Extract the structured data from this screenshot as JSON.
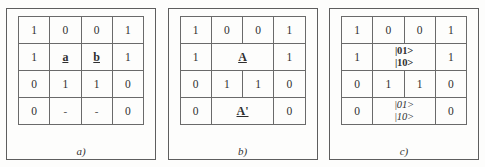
{
  "figure": {
    "panels": [
      {
        "id": "a",
        "label": "a)",
        "rows": [
          {
            "cells": [
              {
                "text": "1",
                "kind": "bit",
                "colspan": 1
              },
              {
                "text": "0",
                "kind": "bit",
                "colspan": 1
              },
              {
                "text": "0",
                "kind": "bit",
                "colspan": 1
              },
              {
                "text": "1",
                "kind": "bit",
                "colspan": 1
              }
            ]
          },
          {
            "cells": [
              {
                "text": "1",
                "kind": "bit",
                "colspan": 1
              },
              {
                "text": "a",
                "kind": "sym",
                "colspan": 1
              },
              {
                "text": "b",
                "kind": "sym",
                "colspan": 1
              },
              {
                "text": "1",
                "kind": "bit",
                "colspan": 1
              }
            ]
          },
          {
            "cells": [
              {
                "text": "0",
                "kind": "bit",
                "colspan": 1
              },
              {
                "text": "1",
                "kind": "bit",
                "colspan": 1
              },
              {
                "text": "1",
                "kind": "bit",
                "colspan": 1
              },
              {
                "text": "0",
                "kind": "bit",
                "colspan": 1
              }
            ]
          },
          {
            "cells": [
              {
                "text": "0",
                "kind": "bit",
                "colspan": 1
              },
              {
                "text": "-",
                "kind": "dash",
                "colspan": 1
              },
              {
                "text": "-",
                "kind": "dash",
                "colspan": 1
              },
              {
                "text": "0",
                "kind": "bit",
                "colspan": 1
              }
            ]
          }
        ]
      },
      {
        "id": "b",
        "label": "b)",
        "rows": [
          {
            "cells": [
              {
                "text": "1",
                "kind": "bit",
                "colspan": 1
              },
              {
                "text": "0",
                "kind": "bit",
                "colspan": 1
              },
              {
                "text": "0",
                "kind": "bit",
                "colspan": 1
              },
              {
                "text": "1",
                "kind": "bit",
                "colspan": 1
              }
            ]
          },
          {
            "cells": [
              {
                "text": "1",
                "kind": "bit",
                "colspan": 1
              },
              {
                "text": "A",
                "kind": "sym",
                "colspan": 2
              },
              {
                "text": "1",
                "kind": "bit",
                "colspan": 1
              }
            ]
          },
          {
            "cells": [
              {
                "text": "0",
                "kind": "bit",
                "colspan": 1
              },
              {
                "text": "1",
                "kind": "bit",
                "colspan": 1
              },
              {
                "text": "1",
                "kind": "bit",
                "colspan": 1
              },
              {
                "text": "0",
                "kind": "bit",
                "colspan": 1
              }
            ]
          },
          {
            "cells": [
              {
                "text": "0",
                "kind": "bit",
                "colspan": 1
              },
              {
                "text": "A'",
                "kind": "sym-prime",
                "colspan": 2
              },
              {
                "text": "0",
                "kind": "bit",
                "colspan": 1
              }
            ]
          }
        ]
      },
      {
        "id": "c",
        "label": "c)",
        "rows": [
          {
            "cells": [
              {
                "text": "1",
                "kind": "bit",
                "colspan": 1
              },
              {
                "text": "0",
                "kind": "bit",
                "colspan": 1
              },
              {
                "text": "0",
                "kind": "bit",
                "colspan": 1
              },
              {
                "text": "1",
                "kind": "bit",
                "colspan": 1
              }
            ]
          },
          {
            "cells": [
              {
                "text": "1",
                "kind": "bit",
                "colspan": 1
              },
              {
                "kind": "ket-bold",
                "colspan": 2,
                "lines": [
                  "|01>",
                  "|10>"
                ]
              },
              {
                "text": "1",
                "kind": "bit",
                "colspan": 1
              }
            ]
          },
          {
            "cells": [
              {
                "text": "0",
                "kind": "bit",
                "colspan": 1
              },
              {
                "text": "1",
                "kind": "bit",
                "colspan": 1
              },
              {
                "text": "1",
                "kind": "bit",
                "colspan": 1
              },
              {
                "text": "0",
                "kind": "bit",
                "colspan": 1
              }
            ]
          },
          {
            "cells": [
              {
                "text": "0",
                "kind": "bit",
                "colspan": 1
              },
              {
                "kind": "ket-italic",
                "colspan": 2,
                "lines": [
                  "|01>",
                  "|10>"
                ]
              },
              {
                "text": "0",
                "kind": "bit",
                "colspan": 1
              }
            ]
          }
        ]
      }
    ]
  }
}
